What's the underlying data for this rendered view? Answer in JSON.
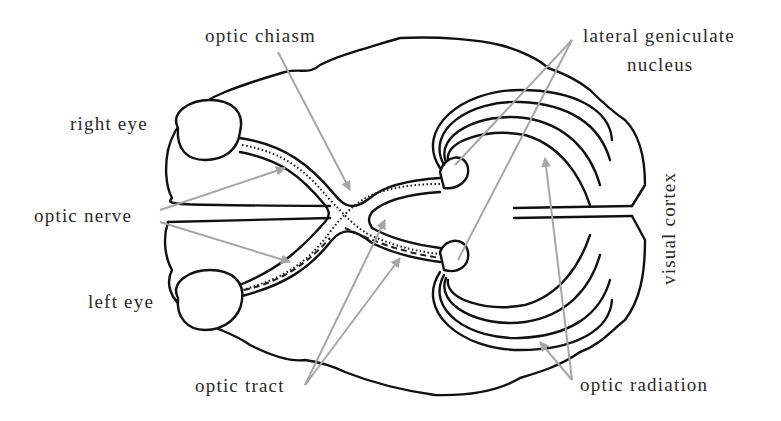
{
  "diagram": {
    "colors": {
      "outline": "#111111",
      "pointer": "#a6a6a6",
      "label": "#2a2a2a",
      "background": "#ffffff"
    },
    "labels": {
      "optic_chiasm": "optic chiasm",
      "lateral_geniculate_line1": "lateral geniculate",
      "lateral_geniculate_line2": "nucleus",
      "right_eye": "right eye",
      "optic_nerve": "optic nerve",
      "left_eye": "left eye",
      "visual_cortex": "visual cortex",
      "optic_tract": "optic tract",
      "optic_radiation": "optic radiation"
    }
  }
}
